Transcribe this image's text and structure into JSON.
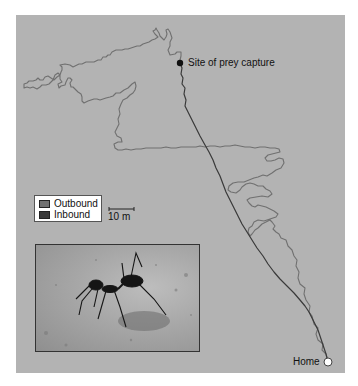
{
  "figure": {
    "background_color": "#b3b3b3",
    "outbound_color": "#707070",
    "inbound_color": "#3a3a3a"
  },
  "markers": {
    "prey_capture": {
      "label": "Site of prey capture",
      "icon": "filled-circle"
    },
    "home": {
      "label": "Home",
      "icon": "open-circle"
    }
  },
  "legend": {
    "items": [
      {
        "label": "Outbound",
        "color": "#707070"
      },
      {
        "label": "Inbound",
        "color": "#3a3a3a"
      }
    ]
  },
  "scale_bar": {
    "label": "10 m"
  },
  "photo_inset": {
    "subject": "desert ant (Cataglyphis) walking on sand",
    "icon": "ant-photo"
  }
}
